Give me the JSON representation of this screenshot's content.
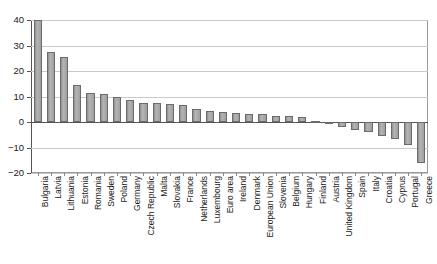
{
  "chart_data": {
    "type": "bar",
    "title": "",
    "subtitle": "",
    "xlabel": "",
    "ylabel": "",
    "ylim": [
      -20,
      40
    ],
    "yticks": [
      40,
      30,
      20,
      10,
      0,
      -10,
      -20
    ],
    "ytick_labels": [
      "40",
      "30",
      "20",
      "10",
      "0",
      "-10",
      "-20"
    ],
    "grid": true,
    "legend": "none",
    "categories": [
      "Bulgaria",
      "Latvia",
      "Lithuania",
      "Estonia",
      "Romania",
      "Sweden",
      "Poland",
      "Germany",
      "Czech Republic",
      "Malta",
      "Slovakia",
      "France",
      "Netherlands",
      "Luxembourg",
      "Euro area",
      "Ireland",
      "Denmark",
      "European Union",
      "Slovenia",
      "Belgium",
      "Hungary",
      "Finland",
      "Austria",
      "United Kingdom",
      "Spain",
      "Italy",
      "Croatia",
      "Cyprus",
      "Portugal",
      "Greece"
    ],
    "values": [
      40.0,
      27.5,
      25.5,
      14.5,
      11.5,
      11.0,
      10.0,
      8.5,
      7.5,
      7.5,
      7.0,
      6.5,
      5.0,
      4.5,
      4.0,
      3.5,
      3.0,
      3.0,
      2.5,
      2.5,
      2.0,
      0.3,
      -0.5,
      -2.0,
      -3.0,
      -4.0,
      -5.5,
      -6.5,
      -9.0,
      -16.0
    ],
    "colors": {
      "bar_fill": "#a6a6a6",
      "bar_edge": "#6b6b6b",
      "gridline": "#c9c9c9",
      "axis": "#555555",
      "text": "#1a1a1a",
      "background": "#ffffff"
    }
  }
}
